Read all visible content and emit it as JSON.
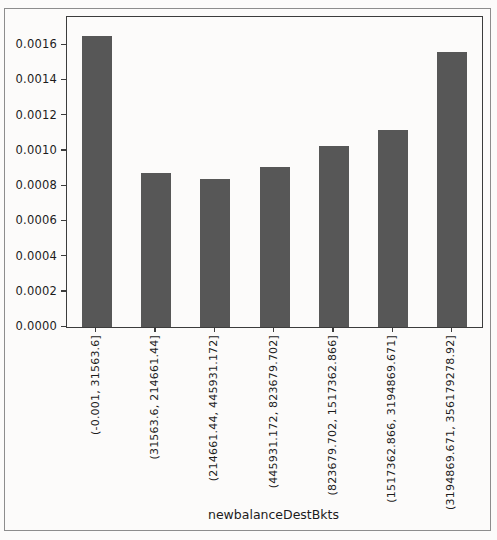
{
  "figure": {
    "background": "#fcfbfa",
    "outer_border_color": "#8d8d8d",
    "axes_border_color": "#3c3c3c"
  },
  "chart_data": {
    "type": "bar",
    "title": "",
    "xlabel": "newbalanceDestBkts",
    "ylabel": "",
    "categories": [
      "(-0.001, 31563.6]",
      "(31563.6, 214661.44]",
      "(214661.44, 445931.172]",
      "(445931.172, 823679.702]",
      "(823679.702, 1517362.866]",
      "(1517362.866, 3194869.671]",
      "(3194869.671, 356179278.92]"
    ],
    "values": [
      0.00165,
      0.000875,
      0.00084,
      0.00091,
      0.00103,
      0.00112,
      0.00156
    ],
    "yticks": [
      "0.0000",
      "0.0002",
      "0.0004",
      "0.0006",
      "0.0008",
      "0.0010",
      "0.0012",
      "0.0014",
      "0.0016"
    ],
    "ytick_values": [
      0.0,
      0.0002,
      0.0004,
      0.0006,
      0.0008,
      0.001,
      0.0012,
      0.0014,
      0.0016
    ],
    "ylim": [
      0,
      0.00176
    ],
    "x_tick_rotation": 90,
    "bar_color": "#575757",
    "grid": false,
    "legend": null
  }
}
